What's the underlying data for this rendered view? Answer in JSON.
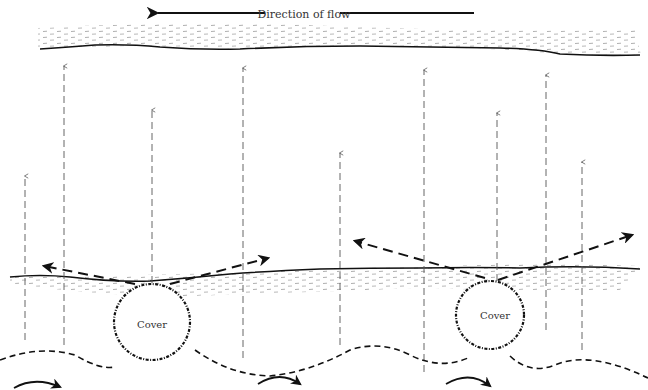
{
  "diagram": {
    "flow_label": "Direction of flow",
    "flow_direction": "left",
    "colors": {
      "ink": "#111111",
      "light_ink": "#777777",
      "background": "#ffffff"
    },
    "covers": [
      {
        "label": "Cover",
        "cx": 152,
        "cy": 322,
        "r": 38
      },
      {
        "label": "Cover",
        "cx": 490,
        "cy": 315,
        "r": 34
      }
    ],
    "vertical_flow_arrows": [
      {
        "x": 25,
        "top": 176,
        "bottom": 340
      },
      {
        "x": 64,
        "top": 66,
        "bottom": 345
      },
      {
        "x": 152,
        "top": 110,
        "bottom": 283
      },
      {
        "x": 243,
        "top": 68,
        "bottom": 358
      },
      {
        "x": 340,
        "top": 153,
        "bottom": 345
      },
      {
        "x": 424,
        "top": 70,
        "bottom": 372
      },
      {
        "x": 497,
        "top": 113,
        "bottom": 281
      },
      {
        "x": 546,
        "top": 75,
        "bottom": 330
      },
      {
        "x": 582,
        "top": 162,
        "bottom": 350
      }
    ],
    "deflection_arrows": [
      {
        "x1": 135,
        "y1": 284,
        "x2": 42,
        "y2": 266
      },
      {
        "x1": 170,
        "y1": 284,
        "x2": 270,
        "y2": 258
      },
      {
        "x1": 485,
        "y1": 278,
        "x2": 353,
        "y2": 241
      },
      {
        "x1": 498,
        "y1": 280,
        "x2": 634,
        "y2": 234
      }
    ],
    "eddy_arrows": [
      {
        "x": 16,
        "y": 385
      },
      {
        "x": 258,
        "y": 380
      },
      {
        "x": 446,
        "y": 381
      }
    ]
  }
}
